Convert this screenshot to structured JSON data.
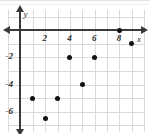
{
  "chart_data": {
    "type": "scatter",
    "title": "",
    "xlabel": "x",
    "ylabel": "y",
    "xlim": [
      -1,
      10
    ],
    "ylim": [
      -7.5,
      1.5
    ],
    "grid": true,
    "legend": null,
    "xticks": [
      2,
      4,
      6,
      8
    ],
    "yticks": [
      -2,
      -4,
      -6
    ],
    "xtick_labels": [
      "2",
      "4",
      "6",
      "8"
    ],
    "ytick_labels": [
      "-2",
      "-4",
      "-6"
    ],
    "points": [
      {
        "x": 1,
        "y": -5
      },
      {
        "x": 2,
        "y": -6.5
      },
      {
        "x": 3,
        "y": -5
      },
      {
        "x": 4,
        "y": -2
      },
      {
        "x": 5,
        "y": -4
      },
      {
        "x": 6,
        "y": -2
      },
      {
        "x": 8,
        "y": 0
      },
      {
        "x": 9,
        "y": -1
      }
    ],
    "marker_color": "#121212",
    "axis_color": "#3a3a3a",
    "grid_color": "#d9d9d9"
  },
  "axis_labels": {
    "x": "x",
    "y": "y"
  },
  "ticks": {
    "x": [
      "2",
      "4",
      "6",
      "8"
    ],
    "y": [
      "-2",
      "-4",
      "-6"
    ]
  }
}
